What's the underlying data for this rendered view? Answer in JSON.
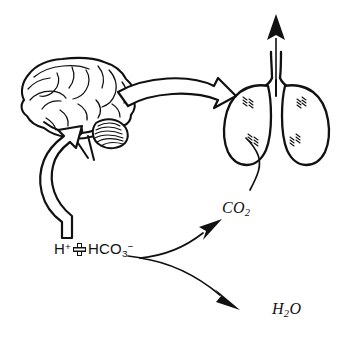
{
  "diagram": {
    "background_color": "#ffffff",
    "ink_color": "#111111",
    "labels": {
      "reaction": {
        "name": "bicarbonate-buffer-equation",
        "proton": "H",
        "proton_charge": "+",
        "plus_symbol": "cross-plus-icon",
        "bicarbonate": "HCO",
        "bicarbonate_subscript": "3",
        "bicarbonate_charge": "−",
        "plain_text": "H+ + HCO3−"
      },
      "carbon_dioxide": {
        "name": "carbon-dioxide-label",
        "base": "CO",
        "subscript": "2",
        "plain_text": "CO2"
      },
      "water": {
        "name": "water-label",
        "base": "H",
        "subscript": "2",
        "suffix": "O",
        "plain_text": "H2O"
      }
    },
    "organs": [
      {
        "name": "brain",
        "label": "brain",
        "detail": "cerebrum with gyri, cerebellum, brainstem, medullary chemoreceptor marker"
      },
      {
        "name": "lungs",
        "label": "lungs",
        "detail": "bilateral lungs with trachea and exhalation arrow"
      }
    ],
    "markers": [
      {
        "name": "medulla-chemoreceptor-dot",
        "shape": "filled-circle"
      }
    ],
    "arrows": [
      {
        "name": "brain-to-lungs-arrow",
        "style": "hollow-block",
        "direction": "right",
        "from": "brain",
        "to": "lungs"
      },
      {
        "name": "stimulus-to-brain-arrow",
        "style": "hollow-block",
        "direction": "up",
        "from": "reaction",
        "to": "brain"
      },
      {
        "name": "reaction-to-co2-arrow",
        "style": "thin-solid-head",
        "direction": "up-right",
        "from": "reaction",
        "to": "carbon_dioxide"
      },
      {
        "name": "reaction-to-water-arrow",
        "style": "thin-solid-head",
        "direction": "down-right",
        "from": "reaction",
        "to": "water"
      },
      {
        "name": "co2-to-lungs-line",
        "style": "thin-line",
        "direction": "up",
        "from": "carbon_dioxide",
        "to": "lungs"
      },
      {
        "name": "exhalation-arrow",
        "style": "thin-solid-head",
        "direction": "up",
        "from": "lungs",
        "to": "atmosphere"
      }
    ]
  }
}
